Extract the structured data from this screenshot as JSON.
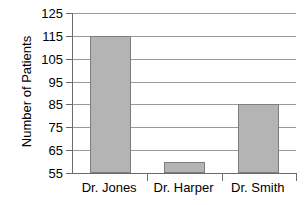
{
  "chart_data": {
    "type": "bar",
    "title": "",
    "xlabel": "",
    "ylabel": "Number of Patients",
    "categories": [
      "Dr. Jones",
      "Dr. Harper",
      "Dr. Smith"
    ],
    "values": [
      115,
      60,
      85
    ],
    "ylim": [
      55,
      125
    ],
    "yticks": [
      55,
      65,
      75,
      85,
      95,
      105,
      115,
      125
    ],
    "ytick_labels": [
      "55",
      "65",
      "75",
      "85",
      "95",
      "105",
      "115",
      "125"
    ],
    "grid": true,
    "legend": false,
    "series": [
      {
        "name": "Number of Patients",
        "values": [
          115,
          60,
          85
        ]
      }
    ],
    "colors": {
      "bar_fill": "#b4b4b4",
      "bar_border": "#7d7d7d",
      "gridline": "#9a9a9a",
      "axis": "#6b6b6b",
      "background": "#ffffff",
      "text": "#000000"
    }
  }
}
